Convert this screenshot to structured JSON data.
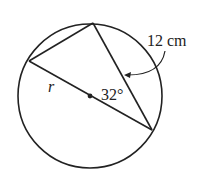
{
  "diagram": {
    "labels": {
      "chord_length": "12 cm",
      "radius": "r",
      "angle": "32°"
    },
    "colors": {
      "stroke": "#222222",
      "background": "#ffffff"
    }
  }
}
